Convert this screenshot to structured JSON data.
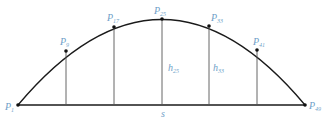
{
  "diagram": {
    "colors": {
      "line": "#1a1a1a",
      "label": "#6f9fc8",
      "background": "#ffffff"
    },
    "baseline": {
      "x1": 18,
      "x2": 305,
      "y": 105
    },
    "arc": {
      "start": [
        18,
        105
      ],
      "control": [
        162,
        -66
      ],
      "end": [
        305,
        105
      ]
    },
    "points": [
      {
        "name": "P",
        "sub": "1",
        "x": 18,
        "y": 105,
        "lx": 5,
        "ly": 110
      },
      {
        "name": "P",
        "sub": "9",
        "x": 66,
        "y": 51,
        "lx": 60,
        "ly": 45
      },
      {
        "name": "P",
        "sub": "17",
        "x": 114,
        "y": 27,
        "lx": 107,
        "ly": 21
      },
      {
        "name": "P",
        "sub": "25",
        "x": 162,
        "y": 19,
        "lx": 154,
        "ly": 14
      },
      {
        "name": "P",
        "sub": "33",
        "x": 209,
        "y": 26,
        "lx": 211,
        "ly": 21
      },
      {
        "name": "P",
        "sub": "41",
        "x": 257,
        "y": 50,
        "lx": 253,
        "ly": 45
      },
      {
        "name": "P",
        "sub": "49",
        "x": 305,
        "y": 105,
        "lx": 309,
        "ly": 109
      }
    ],
    "heights": [
      {
        "name": "h",
        "sub": "25",
        "lx": 168,
        "ly": 71
      },
      {
        "name": "h",
        "sub": "33",
        "lx": 213,
        "ly": 71
      }
    ],
    "chord_label": {
      "text": "s",
      "x": 161,
      "y": 117
    }
  }
}
